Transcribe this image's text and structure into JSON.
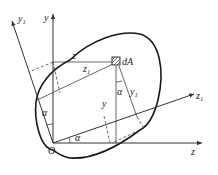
{
  "diagram": {
    "type": "coordinate-rotation",
    "labels": {
      "origin": "O",
      "y_axis": "y",
      "z_axis": "z",
      "y1_axis": "y",
      "y1_sub": "1",
      "z1_axis": "z",
      "z1_sub": "1",
      "element": "dA",
      "z_distance": "z",
      "z1_distance": "z",
      "z1_distance_sub": "1",
      "y_distance": "y",
      "y1_distance": "y",
      "y1_distance_sub": "1",
      "angle_at_dA": "α",
      "angle_left": "α",
      "angle_bottom": "α"
    },
    "colors": {
      "line": "#333333",
      "background": "#ffffff"
    }
  }
}
